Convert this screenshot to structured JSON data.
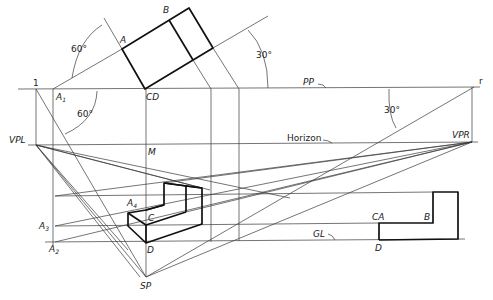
{
  "figure": {
    "type": "two-point perspective construction",
    "colors": {
      "line": "#3a3a3a",
      "object": "#111111",
      "background": "#ffffff"
    }
  },
  "labels": {
    "A": "A",
    "B": "B",
    "CD": "CD",
    "one": "1",
    "A1": "A",
    "A1_sub": "1",
    "angle60_top": "60°",
    "angle60_bottom": "60°",
    "angle30_top": "30°",
    "angle30_right": "30°",
    "PP": "PP",
    "r": "r",
    "VPL": "VPL",
    "VPR": "VPR",
    "Horizon": "Horizon",
    "M": "M",
    "A4": "A",
    "A4_sub": "4",
    "C": "C",
    "A3": "A",
    "A3_sub": "3",
    "A2": "A",
    "A2_sub": "2",
    "D": "D",
    "SP": "SP",
    "GL": "GL",
    "elev_CA": "CA",
    "elev_B": "B",
    "elev_D": "D"
  },
  "points": {
    "one": [
      36,
      89
    ],
    "A1": [
      53,
      89
    ],
    "CD": [
      145,
      89
    ],
    "r": [
      474,
      87
    ],
    "VPL": [
      36,
      145
    ],
    "VPR": [
      472,
      142
    ],
    "SP": [
      146,
      277
    ],
    "plan_A": [
      122,
      49
    ],
    "plan_far": [
      189,
      8
    ],
    "plan_right": [
      213,
      48
    ]
  },
  "lines": {
    "PP_y": 88,
    "horizon_y": 143,
    "GL_y": 241
  }
}
